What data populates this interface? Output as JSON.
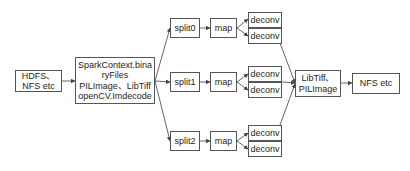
{
  "diagram": {
    "nodes": {
      "source": {
        "label": "HDFS、\nNFS etc"
      },
      "reader": {
        "label": "SparkContext.bina\nryFiles\nPILImage、LibTiff\nopenCV.Imdecode"
      },
      "splits": [
        {
          "label": "split0"
        },
        {
          "label": "split1"
        },
        {
          "label": "split2"
        }
      ],
      "maps": [
        {
          "label": "map"
        },
        {
          "label": "map"
        },
        {
          "label": "map"
        }
      ],
      "deconvs": [
        [
          {
            "label": "deconv"
          },
          {
            "label": "deconv"
          }
        ],
        [
          {
            "label": "deconv"
          },
          {
            "label": "deconv"
          }
        ],
        [
          {
            "label": "deconv"
          },
          {
            "label": "deconv"
          }
        ]
      ],
      "writer": {
        "label": "LibTiff、\nPILImage"
      },
      "sink": {
        "label": "NFS etc"
      }
    },
    "edges": [
      [
        "source",
        "reader"
      ],
      [
        "reader",
        "split0"
      ],
      [
        "reader",
        "split1"
      ],
      [
        "reader",
        "split2"
      ],
      [
        "split0",
        "map0"
      ],
      [
        "split1",
        "map1"
      ],
      [
        "split2",
        "map2"
      ],
      [
        "map0",
        "deconv0a"
      ],
      [
        "map0",
        "deconv0b"
      ],
      [
        "map1",
        "deconv1a"
      ],
      [
        "map1",
        "deconv1b"
      ],
      [
        "map2",
        "deconv2a"
      ],
      [
        "map2",
        "deconv2b"
      ],
      [
        "deconv0b",
        "writer"
      ],
      [
        "deconv1a",
        "writer"
      ],
      [
        "deconv2a",
        "writer"
      ],
      [
        "writer",
        "sink"
      ]
    ],
    "colors": {
      "stroke": "#555555",
      "text": "#1e1e1e",
      "background": "#ffffff"
    }
  }
}
